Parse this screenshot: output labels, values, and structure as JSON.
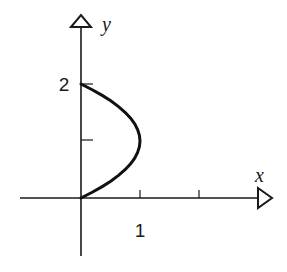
{
  "chart_data": {
    "type": "line",
    "title": "",
    "xlabel": "x",
    "ylabel": "y",
    "xlim": [
      -1,
      3.2
    ],
    "ylim": [
      -1,
      3
    ],
    "grid": false,
    "x_ticks": [
      1,
      2
    ],
    "x_tick_labels": [
      "1",
      ""
    ],
    "y_ticks": [
      1,
      2
    ],
    "y_tick_labels": [
      "",
      "2"
    ],
    "series": [
      {
        "name": "x = y(2 - y)",
        "x": [
          0,
          0.19,
          0.36,
          0.51,
          0.64,
          0.75,
          0.84,
          0.91,
          0.96,
          0.99,
          1,
          0.99,
          0.96,
          0.91,
          0.84,
          0.75,
          0.64,
          0.51,
          0.36,
          0.19,
          0
        ],
        "y": [
          0,
          0.1,
          0.2,
          0.3,
          0.4,
          0.5,
          0.6,
          0.7,
          0.8,
          0.9,
          1,
          1.1,
          1.2,
          1.3,
          1.4,
          1.5,
          1.6,
          1.7,
          1.8,
          1.9,
          2
        ]
      }
    ]
  },
  "labels": {
    "x_axis": "x",
    "y_axis": "y",
    "x_tick_1": "1",
    "y_tick_2": "2"
  }
}
